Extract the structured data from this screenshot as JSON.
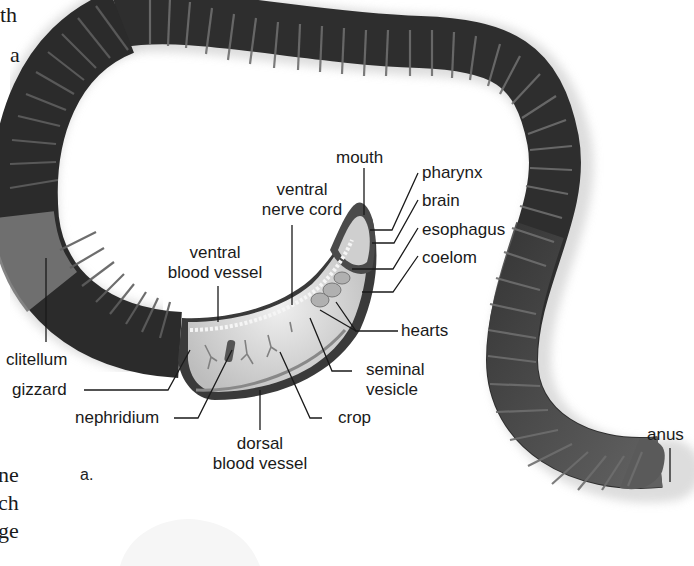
{
  "diagram": {
    "panel_label": "a.",
    "colors": {
      "body_dark": "#2b2b2b",
      "body_mid": "#4a4a4a",
      "segment_highlight": "#6d6d6d",
      "clitellum": "#7a7a7a",
      "cutaway_interior": "#d6d6d6",
      "label_text": "#1a1a1a",
      "leader_line": "#1a1a1a"
    },
    "labels": {
      "mouth": "mouth",
      "pharynx": "pharynx",
      "brain": "brain",
      "esophagus": "esophagus",
      "coelom": "coelom",
      "ventral_nerve_cord_1": "ventral",
      "ventral_nerve_cord_2": "nerve cord",
      "ventral_blood_vessel_1": "ventral",
      "ventral_blood_vessel_2": "blood vessel",
      "hearts": "hearts",
      "seminal_vesicle_1": "seminal",
      "seminal_vesicle_2": "vesicle",
      "clitellum": "clitellum",
      "gizzard": "gizzard",
      "nephridium": "nephridium",
      "crop": "crop",
      "dorsal_blood_vessel_1": "dorsal",
      "dorsal_blood_vessel_2": "blood vessel",
      "anus": "anus"
    },
    "margin_text": {
      "top_1": "th",
      "top_2": "a",
      "bottom_1": "ne",
      "bottom_2": "ch",
      "bottom_3": "ge"
    }
  }
}
